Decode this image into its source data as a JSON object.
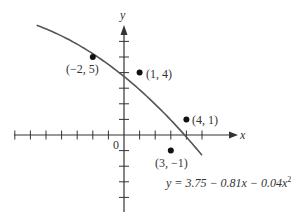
{
  "chart_data": {
    "type": "scatter",
    "title": "",
    "xlabel": "x",
    "ylabel": "y",
    "origin_label": "0",
    "xlim": [
      -8,
      6
    ],
    "ylim": [
      -5,
      6.5
    ],
    "grid": false,
    "tick_spacing": 1,
    "x_ticks": [
      -7,
      -6,
      -5,
      -4,
      -3,
      -2,
      -1,
      1,
      2,
      3,
      4,
      5
    ],
    "y_ticks": [
      -4,
      -3,
      -2,
      -1,
      1,
      2,
      3,
      4,
      5,
      6
    ],
    "points": [
      {
        "x": -2,
        "y": 5,
        "label": "(−2, 5)"
      },
      {
        "x": 1,
        "y": 4,
        "label": "(1, 4)"
      },
      {
        "x": 4,
        "y": 1,
        "label": "(4, 1)"
      },
      {
        "x": 3,
        "y": -1,
        "label": "(3, −1)"
      }
    ],
    "curve": {
      "equation": "y = 3.75 − 0.81x − 0.04x",
      "equation_exponent": "2",
      "a": -0.04,
      "b": -0.81,
      "c": 3.75,
      "x_range": [
        -5.6,
        5.0
      ]
    },
    "colors": {
      "axis": "#333333",
      "curve": "#555555",
      "points": "#111111",
      "text": "#333333"
    }
  }
}
